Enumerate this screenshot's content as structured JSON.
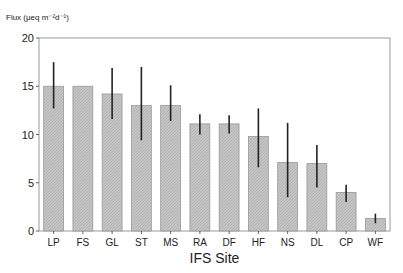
{
  "chart_data": {
    "type": "bar",
    "title": "",
    "ylabel": "Flux  (μeq m⁻²d⁻¹)",
    "xlabel": "IFS Site",
    "ylim": [
      0,
      20
    ],
    "yticks": [
      0,
      5,
      10,
      15,
      20
    ],
    "categories": [
      "LP",
      "FS",
      "GL",
      "ST",
      "MS",
      "RA",
      "DF",
      "HF",
      "NS",
      "DL",
      "CP",
      "WF"
    ],
    "values": [
      15,
      15,
      14.2,
      13,
      13,
      11.1,
      11.1,
      9.8,
      7.1,
      7.0,
      4.0,
      1.3
    ],
    "error_low": [
      12.7,
      15,
      11.6,
      9.4,
      11.4,
      10.0,
      10.1,
      6.6,
      3.5,
      4.5,
      3.0,
      0.8
    ],
    "error_high": [
      17.5,
      15,
      16.9,
      17.0,
      15.1,
      12.1,
      12.0,
      12.7,
      11.2,
      8.9,
      4.8,
      1.8
    ],
    "grid": false
  }
}
